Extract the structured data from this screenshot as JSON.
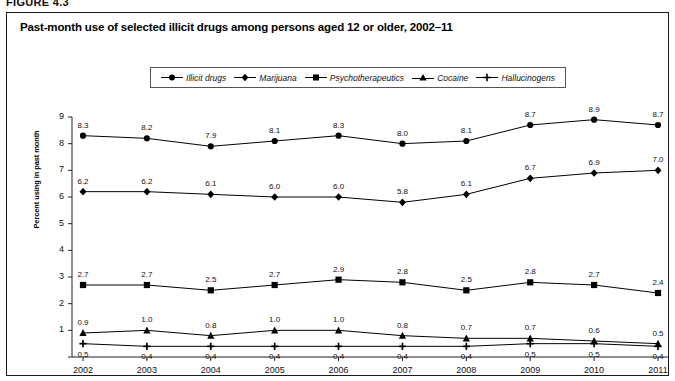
{
  "figure": {
    "label": "FIGURE 4.3"
  },
  "chart_title": "Past-month use of selected illicit drugs among persons aged 12 or older, 2002–11",
  "chart_data": {
    "type": "line",
    "title": "Past-month use of selected illicit drugs among persons aged 12 or older, 2002–11",
    "xlabel": "",
    "ylabel": "Percent using in past month",
    "categories": [
      "2002",
      "2003",
      "2004",
      "2005",
      "2006",
      "2007",
      "2008",
      "2009",
      "2010",
      "2011"
    ],
    "x": [
      2002,
      2003,
      2004,
      2005,
      2006,
      2007,
      2008,
      2009,
      2010,
      2011
    ],
    "ylim": [
      0,
      9
    ],
    "yticks": [
      0,
      1,
      2,
      3,
      4,
      5,
      6,
      7,
      8,
      9
    ],
    "ytick_labels": [
      "",
      "1",
      "2",
      "3",
      "4",
      "5",
      "6",
      "7",
      "8",
      "9"
    ],
    "grid": false,
    "legend_position": "top-center",
    "show_point_labels": true,
    "series": [
      {
        "name": "Illicit drugs",
        "marker": "circle",
        "color": "#000000",
        "values": [
          8.3,
          8.2,
          7.9,
          8.1,
          8.3,
          8.0,
          8.1,
          8.7,
          8.9,
          8.7
        ],
        "labels": [
          "8.3",
          "8.2",
          "7.9",
          "8.1",
          "8.3",
          "8.0",
          "8.1",
          "8.7",
          "8.9",
          "8.7"
        ]
      },
      {
        "name": "Marijuana",
        "marker": "diamond",
        "color": "#000000",
        "values": [
          6.2,
          6.2,
          6.1,
          6.0,
          6.0,
          5.8,
          6.1,
          6.7,
          6.9,
          7.0
        ],
        "labels": [
          "6.2",
          "6.2",
          "6.1",
          "6.0",
          "6.0",
          "5.8",
          "6.1",
          "6.7",
          "6.9",
          "7.0"
        ]
      },
      {
        "name": "Psychotherapeutics",
        "marker": "square",
        "color": "#000000",
        "values": [
          2.7,
          2.7,
          2.5,
          2.7,
          2.9,
          2.8,
          2.5,
          2.8,
          2.7,
          2.4
        ],
        "labels": [
          "2.7",
          "2.7",
          "2.5",
          "2.7",
          "2.9",
          "2.8",
          "2.5",
          "2.8",
          "2.7",
          "2.4"
        ]
      },
      {
        "name": "Cocaine",
        "marker": "triangle",
        "color": "#000000",
        "values": [
          0.9,
          1.0,
          0.8,
          1.0,
          1.0,
          0.8,
          0.7,
          0.7,
          0.6,
          0.5
        ],
        "labels": [
          "0.9",
          "1.0",
          "0.8",
          "1.0",
          "1.0",
          "0.8",
          "0.7",
          "0.7",
          "0.6",
          "0.5"
        ]
      },
      {
        "name": "Hallucinogens",
        "marker": "plus",
        "color": "#000000",
        "values": [
          0.5,
          0.4,
          0.4,
          0.4,
          0.4,
          0.4,
          0.4,
          0.5,
          0.5,
          0.4
        ],
        "labels": [
          "0.5",
          "0.4",
          "0.4",
          "0.4",
          "0.4",
          "0.4",
          "0.4",
          "0.5",
          "0.5",
          "0.4"
        ]
      }
    ]
  }
}
